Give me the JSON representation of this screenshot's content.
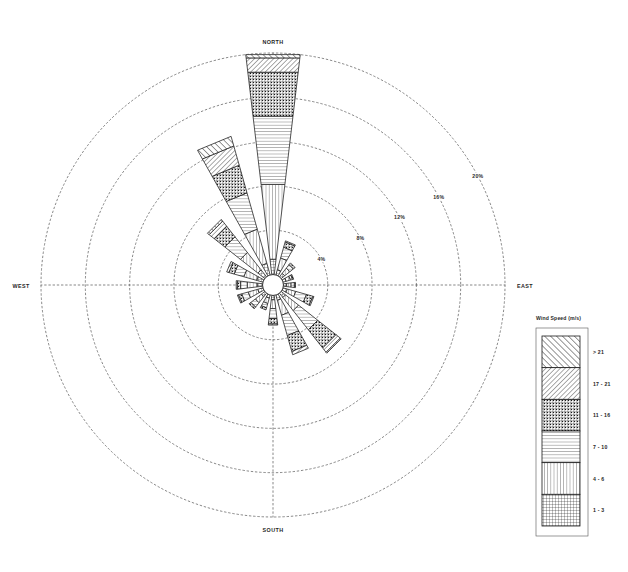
{
  "chart_data": {
    "type": "windrose",
    "title": "",
    "center": {
      "x": 273,
      "y": 285
    },
    "max_radius": 232,
    "grid": true,
    "rings": [
      {
        "value": 4,
        "label": "4%"
      },
      {
        "value": 8,
        "label": "8%"
      },
      {
        "value": 12,
        "label": "12%"
      },
      {
        "value": 16,
        "label": "16%"
      },
      {
        "value": 20,
        "label": "20%"
      }
    ],
    "rlim": [
      0,
      20
    ],
    "runit": "%",
    "cardinal_labels": [
      {
        "name": "north",
        "label": "NORTH",
        "angle": 0
      },
      {
        "name": "east",
        "label": "EAST",
        "angle": 90
      },
      {
        "name": "south",
        "label": "SOUTH",
        "angle": 180
      },
      {
        "name": "west",
        "label": "WEST",
        "angle": 270
      }
    ],
    "calm_radius_pct": 0.9,
    "sector_count": 16,
    "directions": [
      "N",
      "NNE",
      "NE",
      "ENE",
      "E",
      "ESE",
      "SE",
      "SSE",
      "S",
      "SSW",
      "SW",
      "WSW",
      "W",
      "WNW",
      "NW",
      "NNW"
    ],
    "bins": [
      {
        "name": "bin-1-3",
        "label": "1 - 3",
        "pattern": "fine-grid",
        "order": 1
      },
      {
        "name": "bin-4-6",
        "label": "4 - 6",
        "pattern": "vertical",
        "order": 2
      },
      {
        "name": "bin-7-10",
        "label": "7 - 10",
        "pattern": "horizontal",
        "order": 3
      },
      {
        "name": "bin-11-16",
        "label": "11 - 16",
        "pattern": "cross-dot",
        "order": 4
      },
      {
        "name": "bin-17-21",
        "label": "17 - 21",
        "pattern": "diag-fine",
        "order": 5
      },
      {
        "name": "bin-gt21",
        "label": "> 21",
        "pattern": "diag-coarse",
        "order": 6
      }
    ],
    "series": [
      {
        "name": "1 - 3",
        "values": [
          1.4,
          0.5,
          0.4,
          0.3,
          0.3,
          0.4,
          0.5,
          0.5,
          0.4,
          0.3,
          0.4,
          0.5,
          0.5,
          0.6,
          0.8,
          1.1
        ]
      },
      {
        "name": "4 - 6",
        "values": [
          6.8,
          1.1,
          0.6,
          0.4,
          0.4,
          0.8,
          1.5,
          1.4,
          0.8,
          0.5,
          0.7,
          0.9,
          0.9,
          1.2,
          2.0,
          3.2
        ]
      },
      {
        "name": "7 - 10",
        "values": [
          6.2,
          1.0,
          0.4,
          0.2,
          0.3,
          1.0,
          2.2,
          1.9,
          0.9,
          0.4,
          0.5,
          0.6,
          0.6,
          0.9,
          1.8,
          3.4
        ]
      },
      {
        "name": "11 - 16",
        "values": [
          4.0,
          0.5,
          0.2,
          0.1,
          0.1,
          0.6,
          2.1,
          1.5,
          0.5,
          0.2,
          0.2,
          0.3,
          0.3,
          0.5,
          1.2,
          2.6
        ]
      },
      {
        "name": "17 - 21",
        "values": [
          1.3,
          0.1,
          0.0,
          0.0,
          0.0,
          0.1,
          0.5,
          0.3,
          0.1,
          0.0,
          0.0,
          0.1,
          0.1,
          0.2,
          0.6,
          1.8
        ]
      },
      {
        "name": "> 21",
        "values": [
          0.3,
          0.0,
          0.0,
          0.0,
          0.0,
          0.0,
          0.1,
          0.0,
          0.0,
          0.0,
          0.0,
          0.0,
          0.0,
          0.0,
          0.2,
          0.9
        ]
      }
    ],
    "totals": [
      20.0,
      3.2,
      1.6,
      1.0,
      1.1,
      2.9,
      6.9,
      5.6,
      2.7,
      1.4,
      1.8,
      2.4,
      2.4,
      3.4,
      6.6,
      13.0
    ]
  },
  "legend": {
    "title": "Wind Speed (m/s)",
    "box": {
      "x": 542,
      "y": 336,
      "width": 38,
      "height": 190
    },
    "entries": [
      {
        "label": "> 21",
        "pattern": "diag-coarse"
      },
      {
        "label": "17 - 21",
        "pattern": "diag-fine"
      },
      {
        "label": "11 - 16",
        "pattern": "cross-dot"
      },
      {
        "label": "7 - 10",
        "pattern": "horizontal"
      },
      {
        "label": "4 - 6",
        "pattern": "vertical"
      },
      {
        "label": "1 - 3",
        "pattern": "fine-grid"
      }
    ]
  },
  "colors": {
    "background": "#ffffff",
    "grid": "#555555",
    "petal_stroke": "#1a1a1a",
    "text": "#1f1f1f"
  }
}
